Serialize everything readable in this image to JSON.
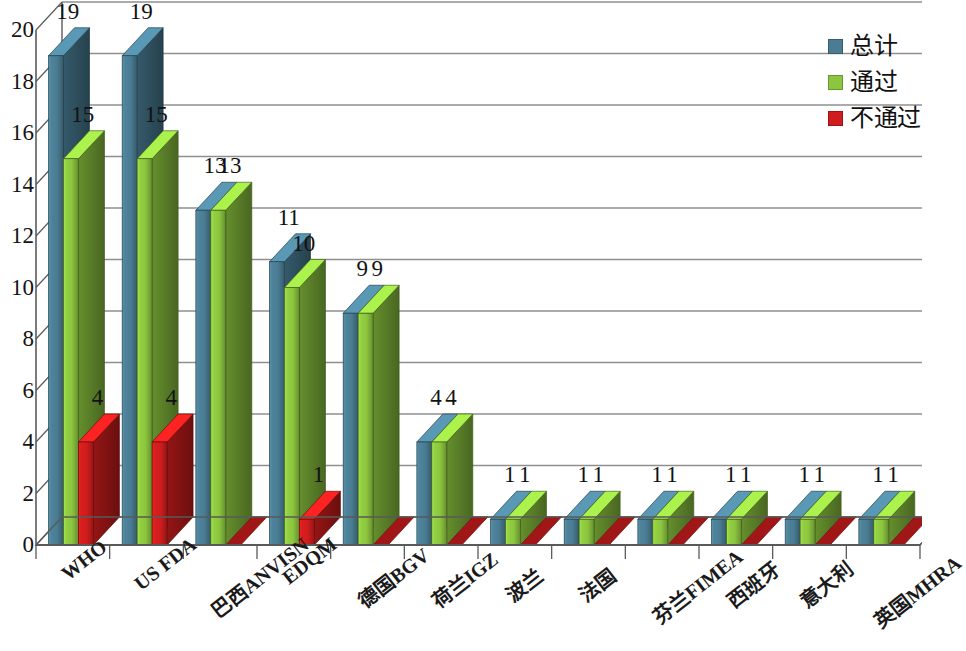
{
  "chart_data": {
    "type": "bar",
    "title": "",
    "subtitle": "",
    "xlabel": "",
    "ylabel": "",
    "ylim": [
      0,
      20
    ],
    "ytick_step": 2,
    "yticks": [
      "0",
      "2",
      "4",
      "6",
      "8",
      "10",
      "12",
      "14",
      "16",
      "18",
      "20"
    ],
    "grid": true,
    "three_d": true,
    "legend_position": "top-right",
    "categories": [
      "WHO",
      "US FDA",
      "巴西ANVISN",
      "EDQM",
      "德国BGV",
      "荷兰IGZ",
      "波兰",
      "法国",
      "芬兰FIMEA",
      "西班牙",
      "意大利",
      "英国MHRA"
    ],
    "series": [
      {
        "name": "总计",
        "color": "#4a7d94",
        "values": [
          19,
          19,
          13,
          11,
          9,
          4,
          1,
          1,
          1,
          1,
          1,
          1
        ]
      },
      {
        "name": "通过",
        "color": "#8cc63f",
        "values": [
          15,
          15,
          13,
          10,
          9,
          4,
          1,
          1,
          1,
          1,
          1,
          1
        ]
      },
      {
        "name": "不通过",
        "color": "#cf1d1d",
        "values": [
          4,
          4,
          0,
          1,
          0,
          0,
          0,
          0,
          0,
          0,
          0,
          0
        ]
      }
    ],
    "data_labels": [
      {
        "category": "WHO",
        "series": "总计",
        "text": "19"
      },
      {
        "category": "WHO",
        "series": "通过",
        "text": "15"
      },
      {
        "category": "WHO",
        "series": "不通过",
        "text": "4"
      },
      {
        "category": "US FDA",
        "series": "总计",
        "text": "19"
      },
      {
        "category": "US FDA",
        "series": "通过",
        "text": "15"
      },
      {
        "category": "US FDA",
        "series": "不通过",
        "text": "4"
      },
      {
        "category": "巴西ANVISN",
        "series": "总计",
        "text": "13"
      },
      {
        "category": "巴西ANVISN",
        "series": "通过",
        "text": "13"
      },
      {
        "category": "EDQM",
        "series": "总计",
        "text": "11"
      },
      {
        "category": "EDQM",
        "series": "通过",
        "text": "10"
      },
      {
        "category": "EDQM",
        "series": "不通过",
        "text": "1"
      },
      {
        "category": "德国BGV",
        "series": "总计",
        "text": "9"
      },
      {
        "category": "德国BGV",
        "series": "通过",
        "text": "9"
      },
      {
        "category": "荷兰IGZ",
        "series": "总计",
        "text": "4"
      },
      {
        "category": "荷兰IGZ",
        "series": "通过",
        "text": "4"
      },
      {
        "category": "波兰",
        "series": "总计",
        "text": "1"
      },
      {
        "category": "波兰",
        "series": "通过",
        "text": "1"
      },
      {
        "category": "法国",
        "series": "总计",
        "text": "1"
      },
      {
        "category": "法国",
        "series": "通过",
        "text": "1"
      },
      {
        "category": "芬兰FIMEA",
        "series": "总计",
        "text": "1"
      },
      {
        "category": "芬兰FIMEA",
        "series": "通过",
        "text": "1"
      },
      {
        "category": "西班牙",
        "series": "总计",
        "text": "1"
      },
      {
        "category": "西班牙",
        "series": "通过",
        "text": "1"
      },
      {
        "category": "意大利",
        "series": "总计",
        "text": "1"
      },
      {
        "category": "意大利",
        "series": "通过",
        "text": "1"
      },
      {
        "category": "英国MHRA",
        "series": "总计",
        "text": "1"
      },
      {
        "category": "英国MHRA",
        "series": "通过",
        "text": "1"
      }
    ]
  },
  "legend": {
    "items": [
      {
        "label": "总计",
        "color": "#4a7d94"
      },
      {
        "label": "通过",
        "color": "#8cc63f"
      },
      {
        "label": "不通过",
        "color": "#cf1d1d"
      }
    ]
  },
  "axes": {
    "y_tick_labels": [
      "20",
      "18",
      "16",
      "14",
      "12",
      "10",
      "8",
      "6",
      "4",
      "2",
      "0"
    ],
    "x_tick_labels": [
      "WHO",
      "US FDA",
      "巴西ANVISN",
      "EDQM",
      "德国BGV",
      "荷兰IGZ",
      "波兰",
      "法国",
      "芬兰FIMEA",
      "西班牙",
      "意大利",
      "英国MHRA"
    ]
  },
  "style": {
    "background": "#ffffff",
    "gridline_color": "#8f8f8f",
    "axis_color": "#5a5a5a",
    "floor_color": "#fbfbfb",
    "bar_top_light": "#ffffff"
  }
}
